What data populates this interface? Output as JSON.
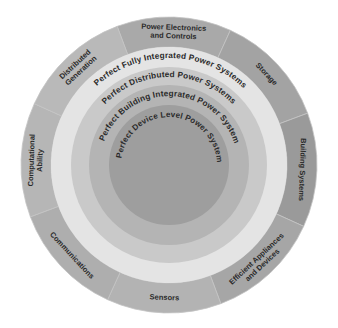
{
  "diagram": {
    "type": "concentric-ring-diagram",
    "center": {
      "x": 169,
      "y": 165
    },
    "outer_segments": [
      {
        "label_lines": [
          "Power Electronics",
          "and Controls"
        ],
        "color": "#a9a9a9"
      },
      {
        "label_lines": [
          "Storage"
        ],
        "color": "#a3a3a3"
      },
      {
        "label_lines": [
          "Building Systems"
        ],
        "color": "#9a9a9a"
      },
      {
        "label_lines": [
          "Efficient Appliances",
          "and Devices"
        ],
        "color": "#a6a6a6"
      },
      {
        "label_lines": [
          "Sensors"
        ],
        "color": "#b3b3b3"
      },
      {
        "label_lines": [
          "Communications"
        ],
        "color": "#aeaeae"
      },
      {
        "label_lines": [
          "Computational",
          "Ability"
        ],
        "color": "#b6b6b6"
      },
      {
        "label_lines": [
          "Distributed",
          "Generation"
        ],
        "color": "#b9b9b9"
      }
    ],
    "rings": [
      {
        "label": "Perfect Fully Integrated Power Systems",
        "color": "#e4e4e4"
      },
      {
        "label": "Perfect Distributed Power Systems",
        "color": "#c9c9c9"
      },
      {
        "label": "Perfect Building Integrated Power System",
        "color": "#b4b4b4"
      },
      {
        "label": "Perfect Device Level Power System",
        "color": "#9e9e9e"
      }
    ]
  }
}
